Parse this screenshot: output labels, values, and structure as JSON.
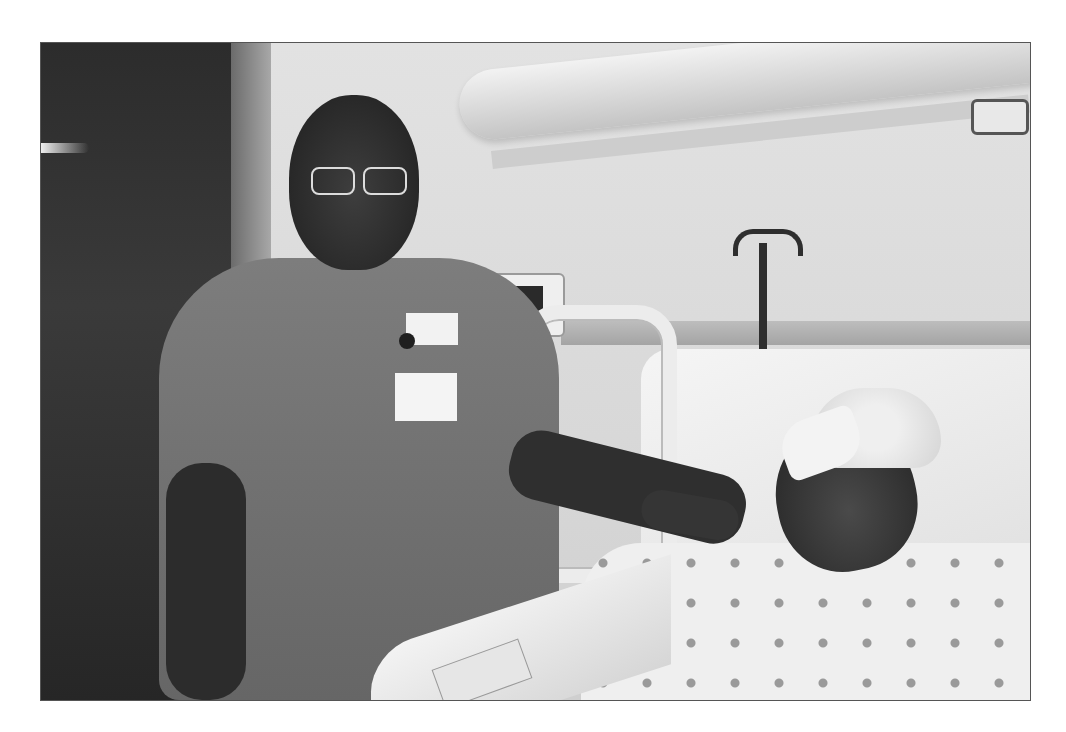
{
  "photo": {
    "description": "Grayscale photograph of a hospital room: a nurse in a dark polo shirt with glasses and ID badge stands beside a hospital bed, resting her hand on the shoulder of a patient wearing a bandage over one eye, a surgical cap, and a polka-dot hospital gown.",
    "tone": "grayscale",
    "frame_border_color": "#555555",
    "background_color": "#ffffff"
  },
  "scene": {
    "elements": [
      "doorway",
      "ceiling-light-fixture",
      "vital-signs-monitor",
      "iv-pole",
      "hospital-bed-rail",
      "bed-control-panel",
      "pillow",
      "nurse",
      "id-badge",
      "patient",
      "eye-bandage",
      "surgical-cap",
      "polka-dot-gown"
    ]
  }
}
